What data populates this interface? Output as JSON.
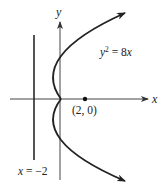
{
  "diagram": {
    "type": "parabola-graph",
    "axes": {
      "x_label": "x",
      "y_label": "y"
    },
    "curve": {
      "equation_lhs": "y",
      "equation_exp": "2",
      "equation_rhs": " = 8",
      "equation_var": "x",
      "equation_full": "y² = 8x"
    },
    "focus": {
      "label": "(2, 0)",
      "x": 2,
      "y": 0
    },
    "directrix": {
      "label_var": "x",
      "label_rest": " = −2",
      "label_full": "x = −2",
      "value": -2
    },
    "colors": {
      "stroke": "#2a2a2a",
      "axis": "#444444",
      "background": "#ffffff"
    }
  }
}
